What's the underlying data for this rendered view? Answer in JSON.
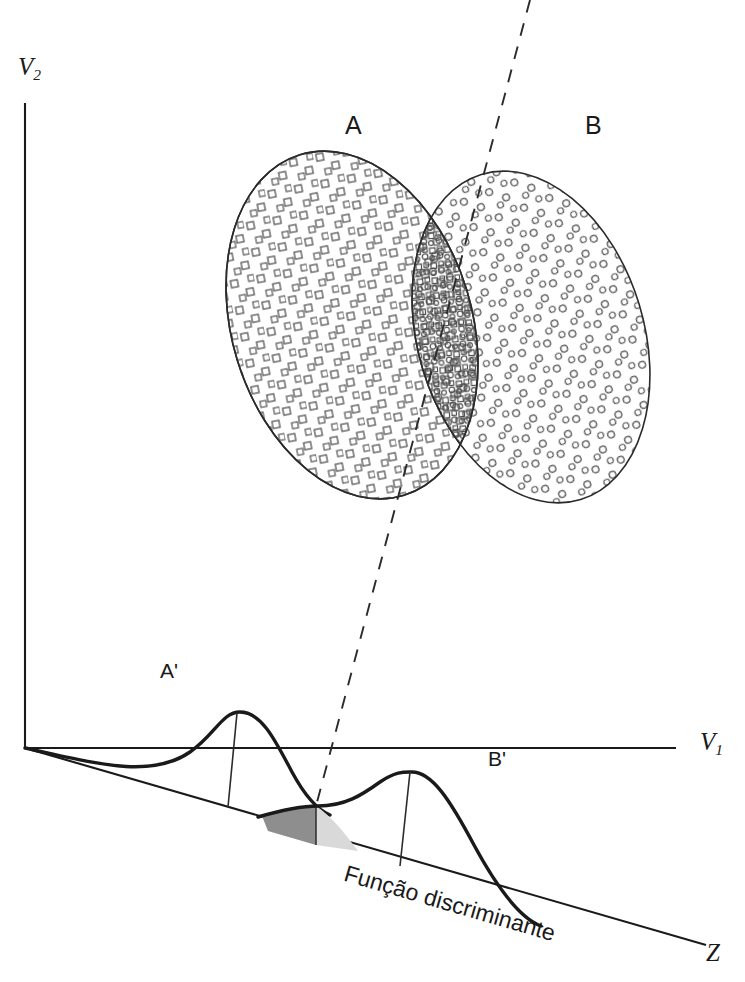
{
  "figure": {
    "type": "diagram",
    "title_text": "",
    "language": "pt-BR"
  },
  "axes": {
    "vertical": {
      "name": "v2-axis",
      "label": "V",
      "sub": "2"
    },
    "horizontal": {
      "name": "v1-axis",
      "label": "V",
      "sub": "1"
    },
    "discriminant": {
      "name": "z-axis",
      "label": "Z"
    }
  },
  "groups": [
    {
      "id": "A",
      "label": "A",
      "marker": "square",
      "name": "ellipse-a"
    },
    {
      "id": "B",
      "label": "B",
      "marker": "circle",
      "name": "ellipse-b"
    }
  ],
  "projections": [
    {
      "id": "A'",
      "label": "A'",
      "name": "curve-a-prime"
    },
    {
      "id": "B'",
      "label": "B'",
      "name": "curve-b-prime"
    }
  ],
  "annotations": {
    "discriminant_function": "Função discriminante"
  },
  "shading": {
    "left_overlap_color": "#8e8e8e",
    "right_overlap_color": "#d9d9d9"
  },
  "colors": {
    "line": "#1a1a1a",
    "thin_line": "#2b2b2b",
    "marker_stroke": "#555555",
    "background": "#ffffff"
  }
}
